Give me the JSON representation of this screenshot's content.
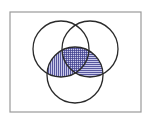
{
  "diagram": {
    "type": "venn",
    "universe": {
      "x": 10,
      "y": 12,
      "width": 131,
      "height": 100,
      "stroke": "#9a9a9a"
    },
    "sets": [
      {
        "id": "A",
        "cx": 61,
        "cy": 49,
        "r": 28,
        "position": "top-left"
      },
      {
        "id": "B",
        "cx": 90,
        "cy": 49,
        "r": 28,
        "position": "top-right"
      },
      {
        "id": "C",
        "cx": 75,
        "cy": 75,
        "r": 28,
        "position": "bottom"
      }
    ],
    "circle_stroke": "#2a2a2a",
    "shaded_regions": [
      {
        "region": "A ∩ C only",
        "pattern": "vertical-lines"
      },
      {
        "region": "B ∩ C only",
        "pattern": "horizontal-lines"
      },
      {
        "region": "A ∩ B ∩ C",
        "pattern": "grid"
      }
    ],
    "hatch_fill": "#c9c9ea",
    "hatch_line": "#3a3a8a"
  }
}
